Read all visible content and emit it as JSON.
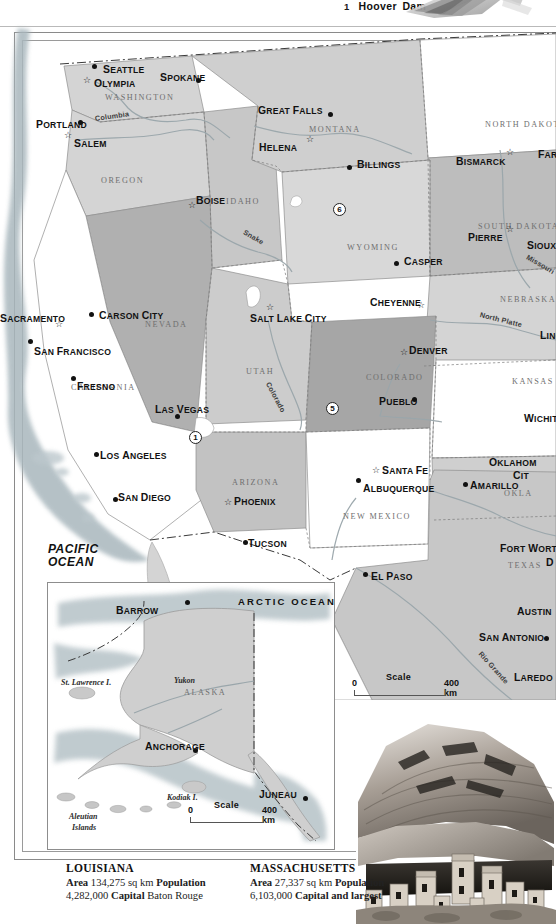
{
  "legend": {
    "number": "1",
    "label": "Hoover Dam",
    "photo_name": "hoover-dam-photo"
  },
  "map": {
    "title": "western-united-states-map",
    "oceans": [
      {
        "name": "pacific-ocean",
        "line1": "PACIFIC",
        "line2": "OCEAN",
        "x": 48,
        "y": 543
      }
    ],
    "states": [
      {
        "name": "washington",
        "label": "WASHINGTON",
        "x": 105,
        "y": 93
      },
      {
        "name": "oregon",
        "label": "OREGON",
        "x": 101,
        "y": 176
      },
      {
        "name": "idaho",
        "label": "IDAHO",
        "x": 226,
        "y": 197
      },
      {
        "name": "montana",
        "label": "MONTANA",
        "x": 309,
        "y": 125
      },
      {
        "name": "north-dakota",
        "label": "NORTH DAKOTA",
        "x": 485,
        "y": 120
      },
      {
        "name": "south-dakota",
        "label": "SOUTH DAKOTA",
        "x": 478,
        "y": 222
      },
      {
        "name": "nebraska",
        "label": "NEBRASKA",
        "x": 500,
        "y": 295
      },
      {
        "name": "wyoming",
        "label": "WYOMING",
        "x": 347,
        "y": 243
      },
      {
        "name": "nevada",
        "label": "NEVADA",
        "x": 145,
        "y": 320
      },
      {
        "name": "utah",
        "label": "UTAH",
        "x": 246,
        "y": 367
      },
      {
        "name": "colorado",
        "label": "COLORADO",
        "x": 366,
        "y": 373
      },
      {
        "name": "kansas",
        "label": "KANSAS",
        "x": 512,
        "y": 377
      },
      {
        "name": "california",
        "label": "CALIFORNIA",
        "x": 71,
        "y": 383
      },
      {
        "name": "arizona",
        "label": "ARIZONA",
        "x": 232,
        "y": 478
      },
      {
        "name": "new-mexico",
        "label": "NEW MEXICO",
        "x": 343,
        "y": 512
      },
      {
        "name": "oklahoma",
        "label": "OKLA",
        "x": 504,
        "y": 489
      },
      {
        "name": "texas",
        "label": "TEXAS",
        "x": 508,
        "y": 561
      }
    ],
    "cities": [
      {
        "name": "seattle",
        "label": "SEATTLE",
        "x": 103,
        "y": 64,
        "marker": "dot",
        "mx": 92,
        "my": 64,
        "anchor": "left"
      },
      {
        "name": "olympia",
        "label": "OLYMPIA",
        "x": 94,
        "y": 78,
        "marker": "star",
        "mx": 83,
        "my": 76,
        "anchor": "left"
      },
      {
        "name": "spokane",
        "label": "SPOKANE",
        "x": 160,
        "y": 72,
        "marker": "dot",
        "mx": 196,
        "my": 78,
        "anchor": "left"
      },
      {
        "name": "portland",
        "label": "PORTLAND",
        "x": 36,
        "y": 119,
        "marker": "dot",
        "mx": 78,
        "my": 120,
        "anchor": "left"
      },
      {
        "name": "salem",
        "label": "SALEM",
        "x": 74,
        "y": 138,
        "marker": "star",
        "mx": 64,
        "my": 131,
        "anchor": "left"
      },
      {
        "name": "boise",
        "label": "BOISE",
        "x": 196,
        "y": 195,
        "marker": "star",
        "mx": 188,
        "my": 201,
        "anchor": "left"
      },
      {
        "name": "great-falls",
        "label": "GREAT FALLS",
        "x": 258,
        "y": 105,
        "marker": "dot",
        "mx": 328,
        "my": 112,
        "anchor": "left"
      },
      {
        "name": "helena",
        "label": "HELENA",
        "x": 259,
        "y": 142,
        "marker": "star",
        "mx": 306,
        "my": 135,
        "anchor": "left"
      },
      {
        "name": "billings",
        "label": "BILLINGS",
        "x": 357,
        "y": 159,
        "marker": "dot",
        "mx": 347,
        "my": 165,
        "anchor": "left"
      },
      {
        "name": "bismarck",
        "label": "BISMARCK",
        "x": 456,
        "y": 156,
        "marker": "star",
        "mx": 506,
        "my": 148,
        "anchor": "left"
      },
      {
        "name": "fargo",
        "label": "FAR",
        "x": 538,
        "y": 149,
        "marker": "none",
        "mx": 0,
        "my": 0,
        "anchor": "left"
      },
      {
        "name": "pierre",
        "label": "PIERRE",
        "x": 468,
        "y": 232,
        "marker": "star",
        "mx": 506,
        "my": 225,
        "anchor": "left"
      },
      {
        "name": "sioux-falls",
        "label": "SIOUX F",
        "x": 527,
        "y": 240,
        "marker": "none",
        "mx": 0,
        "my": 0,
        "anchor": "left"
      },
      {
        "name": "casper",
        "label": "CASPER",
        "x": 404,
        "y": 256,
        "marker": "dot",
        "mx": 394,
        "my": 261,
        "anchor": "left"
      },
      {
        "name": "cheyenne",
        "label": "CHEYENNE",
        "x": 370,
        "y": 297,
        "marker": "star",
        "mx": 417,
        "my": 301,
        "anchor": "left"
      },
      {
        "name": "lincoln",
        "label": "LINC",
        "x": 540,
        "y": 330,
        "marker": "none",
        "mx": 0,
        "my": 0,
        "anchor": "left"
      },
      {
        "name": "sacramento",
        "label": "SACRAMENTO",
        "x": 0,
        "y": 313,
        "marker": "star",
        "mx": 55,
        "my": 320,
        "anchor": "left"
      },
      {
        "name": "carson-city",
        "label": "CARSON CITY",
        "x": 99,
        "y": 310,
        "marker": "dot",
        "mx": 89,
        "my": 312,
        "anchor": "left"
      },
      {
        "name": "san-francisco",
        "label": "SAN FRANCISCO",
        "x": 34,
        "y": 346,
        "marker": "dot",
        "mx": 28,
        "my": 339,
        "anchor": "left"
      },
      {
        "name": "fresno",
        "label": "FRESNO",
        "x": 77,
        "y": 381,
        "marker": "dot",
        "mx": 71,
        "my": 376,
        "anchor": "left"
      },
      {
        "name": "salt-lake-city",
        "label": "SALT LAKE CITY",
        "x": 250,
        "y": 313,
        "marker": "star",
        "mx": 266,
        "my": 303,
        "anchor": "left"
      },
      {
        "name": "denver",
        "label": "DENVER",
        "x": 409,
        "y": 345,
        "marker": "star",
        "mx": 400,
        "my": 348,
        "anchor": "left"
      },
      {
        "name": "pueblo",
        "label": "PUEBLO",
        "x": 379,
        "y": 396,
        "marker": "dot",
        "mx": 412,
        "my": 397,
        "anchor": "left"
      },
      {
        "name": "wichita",
        "label": "WICHIT",
        "x": 524,
        "y": 413,
        "marker": "none",
        "mx": 0,
        "my": 0,
        "anchor": "left"
      },
      {
        "name": "las-vegas",
        "label": "LAS VEGAS",
        "x": 155,
        "y": 404,
        "marker": "dot",
        "mx": 175,
        "my": 414,
        "anchor": "left"
      },
      {
        "name": "los-angeles",
        "label": "LOS ANGELES",
        "x": 100,
        "y": 450,
        "marker": "dot",
        "mx": 94,
        "my": 452,
        "anchor": "left"
      },
      {
        "name": "san-diego",
        "label": "SAN DIEGO",
        "x": 118,
        "y": 492,
        "marker": "dot",
        "mx": 113,
        "my": 497,
        "anchor": "left"
      },
      {
        "name": "phoenix",
        "label": "PHOENIX",
        "x": 234,
        "y": 496,
        "marker": "star",
        "mx": 224,
        "my": 498,
        "anchor": "left"
      },
      {
        "name": "tucson",
        "label": "TUCSON",
        "x": 248,
        "y": 538,
        "marker": "dot",
        "mx": 243,
        "my": 540,
        "anchor": "left"
      },
      {
        "name": "santa-fe",
        "label": "SANTA FE",
        "x": 382,
        "y": 465,
        "marker": "star",
        "mx": 372,
        "my": 466,
        "anchor": "left"
      },
      {
        "name": "albuquerque",
        "label": "ALBUQUERQUE",
        "x": 363,
        "y": 483,
        "marker": "dot",
        "mx": 356,
        "my": 478,
        "anchor": "left"
      },
      {
        "name": "amarillo",
        "label": "AMARILLO",
        "x": 470,
        "y": 480,
        "marker": "dot",
        "mx": 463,
        "my": 482,
        "anchor": "left"
      },
      {
        "name": "oklahoma-city",
        "label": "OKLAHOM",
        "x": 489,
        "y": 457,
        "marker": "none",
        "mx": 0,
        "my": 0,
        "anchor": "left"
      },
      {
        "name": "oklahoma-city-line2",
        "label": "CIT",
        "x": 513,
        "y": 470,
        "marker": "none",
        "mx": 0,
        "my": 0,
        "anchor": "left"
      },
      {
        "name": "fort-worth",
        "label": "FORT WORT",
        "x": 500,
        "y": 543,
        "marker": "none",
        "mx": 0,
        "my": 0,
        "anchor": "left"
      },
      {
        "name": "dallas",
        "label": "D",
        "x": 546,
        "y": 557,
        "marker": "none",
        "mx": 0,
        "my": 0,
        "anchor": "left"
      },
      {
        "name": "austin",
        "label": "AUSTIN",
        "x": 517,
        "y": 606,
        "marker": "none",
        "mx": 0,
        "my": 0,
        "anchor": "left"
      },
      {
        "name": "san-antonio",
        "label": "SAN ANTONIO",
        "x": 479,
        "y": 632,
        "marker": "dot",
        "mx": 544,
        "my": 636,
        "anchor": "left"
      },
      {
        "name": "laredo",
        "label": "LAREDO",
        "x": 514,
        "y": 672,
        "marker": "none",
        "mx": 0,
        "my": 0,
        "anchor": "left"
      },
      {
        "name": "el-paso",
        "label": "EL PASO",
        "x": 371,
        "y": 571,
        "marker": "dot",
        "mx": 363,
        "my": 572,
        "anchor": "left"
      }
    ],
    "rivers": [
      {
        "name": "columbia-river",
        "label": "Columbia",
        "x": 95,
        "y": 114,
        "rot": -8
      },
      {
        "name": "snake-river",
        "label": "Snake",
        "x": 244,
        "y": 227,
        "rot": 30
      },
      {
        "name": "colorado-river",
        "label": "Colorado",
        "x": 268,
        "y": 378,
        "rot": 62
      },
      {
        "name": "missouri-river",
        "label": "Missouri",
        "x": 527,
        "y": 252,
        "rot": 30
      },
      {
        "name": "north-platte-river",
        "label": "North Platte",
        "x": 480,
        "y": 310,
        "rot": 14
      },
      {
        "name": "rio-grande-river",
        "label": "Rio Grande",
        "x": 480,
        "y": 648,
        "rot": 48
      }
    ],
    "pins": [
      {
        "name": "pin-1-hoover-dam",
        "number": "1",
        "x": 189,
        "y": 431
      },
      {
        "name": "pin-5",
        "number": "5",
        "x": 326,
        "y": 402
      },
      {
        "name": "pin-6",
        "number": "6",
        "x": 333,
        "y": 203
      }
    ],
    "scale": {
      "name": "main-map-scale",
      "title": "Scale",
      "min": "0",
      "max": "400 km",
      "x": 352,
      "y": 672
    }
  },
  "inset": {
    "name": "alaska-inset",
    "ocean": "ARCTIC OCEAN",
    "region": "ALASKA",
    "cities": [
      {
        "name": "barrow",
        "label": "BARROW",
        "x": 116,
        "y": 605
      },
      {
        "name": "anchorage",
        "label": "ANCHORAGE",
        "x": 145,
        "y": 741
      },
      {
        "name": "juneau",
        "label": "JUNEAU",
        "x": 259,
        "y": 789
      }
    ],
    "features": [
      {
        "name": "st-lawrence-island",
        "label": "St. Lawrence I.",
        "x": 61,
        "y": 678
      },
      {
        "name": "yukon-river",
        "label": "Yukon",
        "x": 174,
        "y": 676
      },
      {
        "name": "kodiak-island",
        "label": "Kodiak I.",
        "x": 167,
        "y": 793
      },
      {
        "name": "aleutian-islands-1",
        "label": "Aleutian",
        "x": 69,
        "y": 812
      },
      {
        "name": "aleutian-islands-2",
        "label": "Islands",
        "x": 72,
        "y": 823
      }
    ],
    "scale": {
      "name": "inset-scale",
      "title": "Scale",
      "min": "0",
      "max": "400 km",
      "x": 188,
      "y": 800
    }
  },
  "photo": {
    "name": "cliff-dwelling-photo"
  },
  "facts": [
    {
      "name": "louisiana",
      "state": "LOUISIANA",
      "line1_label": "Area",
      "line1_value": "134,275 sq km",
      "line2_label": "Population",
      "line2_value": "4,282,000",
      "line3_label": "Capital",
      "line3_value": "Baton Rouge"
    },
    {
      "name": "massachusetts",
      "state": "MASSACHUSETTS",
      "line1_label": "Area",
      "line1_value": "27,337 sq km",
      "line2_label": "Population",
      "line2_value": "6,103,000",
      "line3_label": "Capital and largest",
      "line3_value": ""
    }
  ],
  "colors": {
    "land_light": "#d7d7d7",
    "land_mid": "#c4c4c4",
    "land_dark": "#a8a8a8",
    "land_white": "#ffffff",
    "border": "#8a8a8a",
    "water": "#b9c6cc",
    "text": "#111111"
  }
}
